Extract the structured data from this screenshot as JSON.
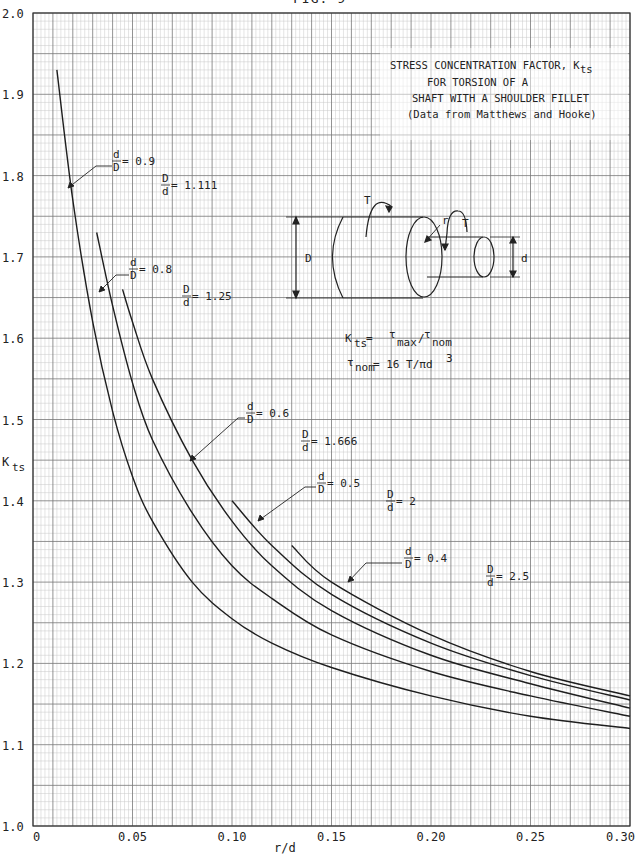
{
  "figure": {
    "label": "FIG. 9"
  },
  "chart_data": {
    "type": "line",
    "subtitle": "(Data from Matthews and Hooke)",
    "title_lines": [
      "STRESS CONCENTRATION FACTOR, K",
      "FOR TORSION OF A",
      "SHAFT WITH A SHOULDER FILLET",
      "(Data from Matthews and Hooke)"
    ],
    "title_sub": "ts",
    "xlabel": "r/d",
    "ylabel": "K",
    "ylabel_sub": "ts",
    "xlim": [
      0,
      0.3
    ],
    "ylim": [
      1.0,
      2.0
    ],
    "x_ticks": [
      "0",
      "0.05",
      "0.10",
      "0.15",
      "0.20",
      "0.25",
      "0.30"
    ],
    "y_ticks": [
      "1.0",
      "1.1",
      "1.2",
      "1.3",
      "1.4",
      "1.5",
      "1.6",
      "1.7",
      "1.8",
      "1.9",
      "2.0"
    ],
    "grid": true,
    "legend": "inline labels",
    "series": [
      {
        "name": "d/D = 0.9, D/d = 1.111",
        "x": [
          0.012,
          0.02,
          0.03,
          0.04,
          0.05,
          0.06,
          0.08,
          0.1,
          0.12,
          0.15,
          0.2,
          0.25,
          0.3
        ],
        "y": [
          1.93,
          1.77,
          1.62,
          1.51,
          1.43,
          1.375,
          1.3,
          1.255,
          1.225,
          1.195,
          1.16,
          1.135,
          1.12
        ]
      },
      {
        "name": "d/D = 0.8, D/d = 1.25",
        "x": [
          0.032,
          0.04,
          0.05,
          0.06,
          0.08,
          0.1,
          0.12,
          0.15,
          0.2,
          0.25,
          0.3
        ],
        "y": [
          1.73,
          1.64,
          1.545,
          1.475,
          1.385,
          1.32,
          1.28,
          1.235,
          1.19,
          1.16,
          1.135
        ]
      },
      {
        "name": "d/D = 0.6, D/d = 1.666",
        "x": [
          0.045,
          0.05,
          0.06,
          0.08,
          0.1,
          0.12,
          0.15,
          0.2,
          0.25,
          0.3
        ],
        "y": [
          1.66,
          1.62,
          1.55,
          1.45,
          1.375,
          1.32,
          1.265,
          1.21,
          1.175,
          1.145
        ]
      },
      {
        "name": "d/D = 0.5, D/d = 2",
        "x": [
          0.1,
          0.12,
          0.15,
          0.2,
          0.25,
          0.3
        ],
        "y": [
          1.4,
          1.345,
          1.285,
          1.225,
          1.185,
          1.155
        ]
      },
      {
        "name": "d/D = 0.4, D/d = 2.5",
        "x": [
          0.13,
          0.15,
          0.2,
          0.25,
          0.3
        ],
        "y": [
          1.345,
          1.3,
          1.235,
          1.19,
          1.16
        ]
      }
    ],
    "annotations": [
      {
        "text": "d/D = 0.9",
        "num": "d",
        "den": "D",
        "val": "= 0.9"
      },
      {
        "text": "D/d = 1.111",
        "num": "D",
        "den": "d",
        "val": "= 1.111"
      },
      {
        "text": "d/D = 0.8",
        "num": "d",
        "den": "D",
        "val": "= 0.8"
      },
      {
        "text": "D/d = 1.25",
        "num": "D",
        "den": "d",
        "val": "= 1.25"
      },
      {
        "text": "d/D = 0.6",
        "num": "d",
        "den": "D",
        "val": "= 0.6"
      },
      {
        "text": "D/d = 1.666",
        "num": "D",
        "den": "d",
        "val": "= 1.666"
      },
      {
        "text": "d/D = 0.5",
        "num": "d",
        "den": "D",
        "val": "= 0.5"
      },
      {
        "text": "D/d = 2",
        "num": "D",
        "den": "d",
        "val": "= 2"
      },
      {
        "text": "d/D = 0.4",
        "num": "d",
        "den": "D",
        "val": "= 0.4"
      },
      {
        "text": "D/d = 2.5",
        "num": "D",
        "den": "d",
        "val": "= 2.5"
      }
    ],
    "diagram": {
      "labels": {
        "torque": "T",
        "radius": "r",
        "large_dia": "D",
        "small_dia": "d"
      },
      "formula1": {
        "lhs": "K",
        "lhs_sub": "ts",
        "eq": " = ",
        "num": "τ",
        "num_sub": "max",
        "slash": "/",
        "den": "τ",
        "den_sub": "nom"
      },
      "formula2": {
        "lhs": "τ",
        "lhs_sub": "nom",
        "rhs": " = 16 T/πd",
        "rhs_sup": "3"
      }
    }
  }
}
